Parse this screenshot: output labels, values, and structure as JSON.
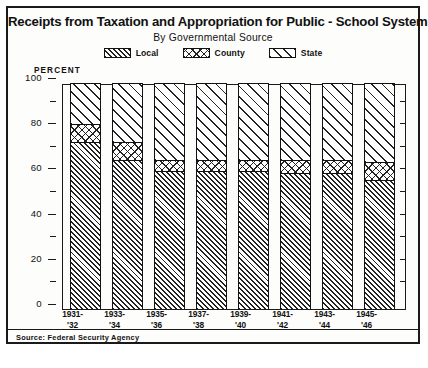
{
  "figure": {
    "title": "Receipts from Taxation and Appropriation for Public - School System",
    "subtitle": "By Governmental Source",
    "source": "Source: Federal Security Agency",
    "caption": ""
  },
  "legend": {
    "position": "top-center",
    "items": [
      {
        "label": "Local",
        "pattern": "dense-diagonal-hatch",
        "swatch_name": "legend-swatch-local"
      },
      {
        "label": "County",
        "pattern": "crosshatch-diamond",
        "swatch_name": "legend-swatch-county"
      },
      {
        "label": "State",
        "pattern": "sparse-diagonal-hatch",
        "swatch_name": "legend-swatch-state"
      }
    ]
  },
  "axes": {
    "y_title": "PERCENT",
    "y_ticks": [
      "0",
      "20",
      "40",
      "60",
      "80",
      "100"
    ],
    "y_minor_ticks": [
      10,
      30,
      50,
      70,
      90
    ],
    "x_labels": [
      {
        "line1": "1931-",
        "line2": "'32"
      },
      {
        "line1": "1933-",
        "line2": "'34"
      },
      {
        "line1": "1935-",
        "line2": "'36"
      },
      {
        "line1": "1937-",
        "line2": "'38"
      },
      {
        "line1": "1939-",
        "line2": "'40"
      },
      {
        "line1": "1941-",
        "line2": "'42"
      },
      {
        "line1": "1943-",
        "line2": "'44"
      },
      {
        "line1": "1945-",
        "line2": "'46"
      }
    ]
  },
  "chart_data": {
    "type": "bar",
    "stacked": true,
    "stacked_to_total": 100,
    "title": "Receipts from Taxation and Appropriation for Public - School System",
    "subtitle": "By Governmental Source",
    "xlabel": "",
    "ylabel": "PERCENT",
    "ylim": [
      0,
      100
    ],
    "ytick_interval": 20,
    "yminor_interval": 10,
    "grid": false,
    "legend_position": "top-center",
    "categories": [
      "1931-'32",
      "1933-'34",
      "1935-'36",
      "1937-'38",
      "1939-'40",
      "1941-'42",
      "1943-'44",
      "1945-'46"
    ],
    "series": [
      {
        "name": "Local",
        "values": [
          74,
          66,
          61,
          61,
          61,
          60,
          60,
          57
        ]
      },
      {
        "name": "County",
        "values": [
          8,
          8,
          5,
          5,
          5,
          6,
          6,
          8
        ]
      },
      {
        "name": "State",
        "values": [
          18,
          26,
          34,
          34,
          34,
          34,
          34,
          35
        ]
      }
    ],
    "cumulative_tops": {
      "local": [
        74,
        66,
        61,
        61,
        61,
        60,
        60,
        57
      ],
      "county": [
        82,
        74,
        66,
        66,
        66,
        66,
        66,
        65
      ],
      "state": [
        100,
        100,
        100,
        100,
        100,
        100,
        100,
        100
      ]
    }
  }
}
